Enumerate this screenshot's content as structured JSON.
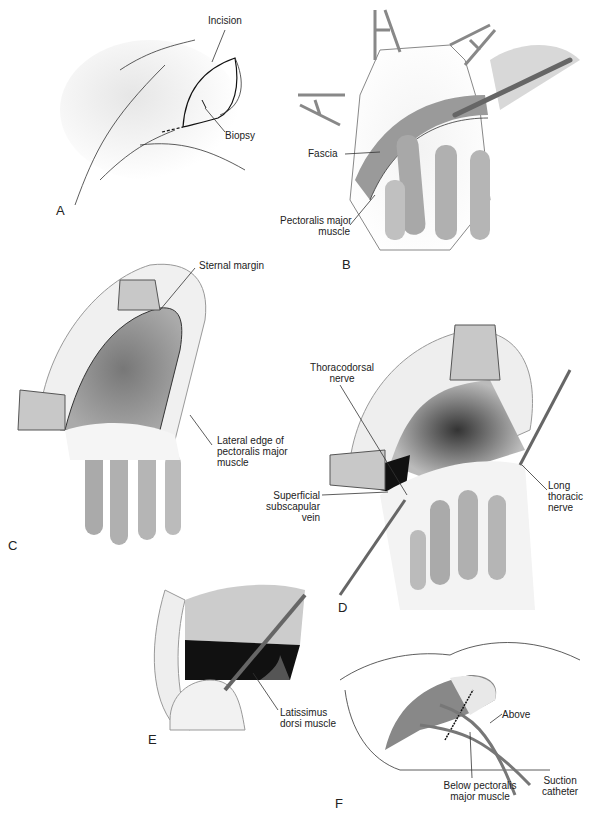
{
  "figure": {
    "panels": [
      {
        "id": "A",
        "letter": "A",
        "labels": {
          "incision": "Incision",
          "biopsy": "Biopsy"
        }
      },
      {
        "id": "B",
        "letter": "B",
        "labels": {
          "fascia": "Fascia",
          "pectoralis_1": "Pectoralis major",
          "pectoralis_2": "muscle"
        }
      },
      {
        "id": "C",
        "letter": "C",
        "labels": {
          "sternal_margin": "Sternal margin",
          "lateral_1": "Lateral edge of",
          "lateral_2": "pectoralis major",
          "lateral_3": "muscle"
        }
      },
      {
        "id": "D",
        "letter": "D",
        "labels": {
          "thoracodorsal_1": "Thoracodorsal",
          "thoracodorsal_2": "nerve",
          "superficial_1": "Superficial",
          "superficial_2": "subscapular",
          "superficial_3": "vein",
          "long_1": "Long",
          "long_2": "thoracic",
          "long_3": "nerve"
        }
      },
      {
        "id": "E",
        "letter": "E",
        "labels": {
          "latissimus_1": "Latissimus",
          "latissimus_2": "dorsi muscle"
        }
      },
      {
        "id": "F",
        "letter": "F",
        "labels": {
          "above": "Above",
          "below_1": "Below pectoralis",
          "below_2": "major muscle",
          "suction_1": "Suction",
          "suction_2": "catheter"
        }
      }
    ]
  }
}
